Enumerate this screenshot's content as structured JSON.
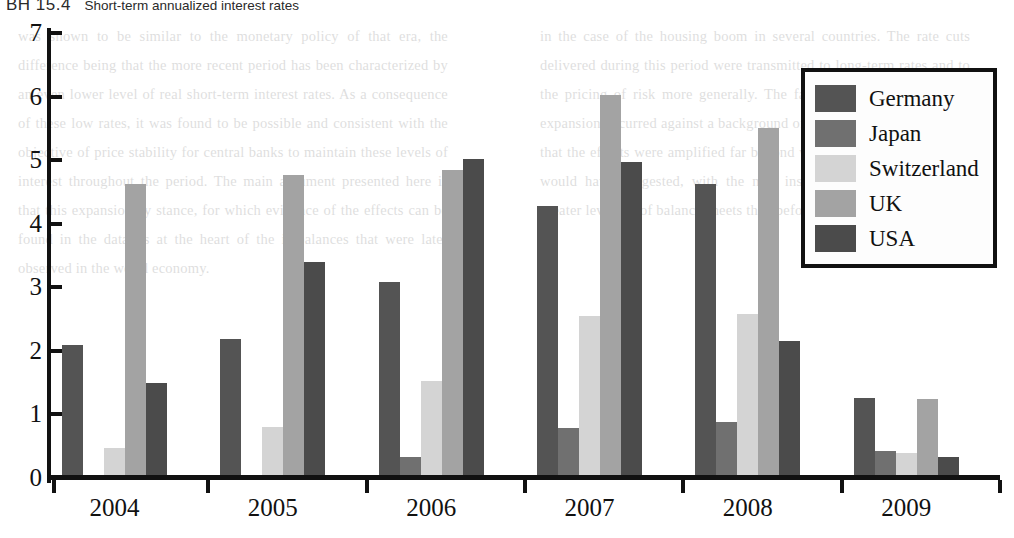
{
  "figure": {
    "number": "BH 15.4",
    "title": "Short-term annualized interest rates"
  },
  "background_text": {
    "left": "was shown to be similar to the monetary policy of that era, the difference being that the more recent period has been characterized by an even lower level of real short-term interest rates. As a consequence of these low rates, it was found to be possible and consistent with the objective of price stability for central banks to maintain these levels of interest throughout the period. The main argument presented here is that this expansionary stance, for which evidence of the effects can be found in the data, is at the heart of the imbalances that were later observed in the world economy.",
    "right": "in the case of the housing boom in several countries. The rate cuts delivered during this period were transmitted to long-term rates and to the pricing of risk more generally. The fact that the resulting credit expansion occurred against a background of financial innovation meant that the effects were amplified far beyond what historical relationships would have suggested, with the new instruments allowing a much greater leverage of balance sheets than before."
  },
  "legend": {
    "position": "right",
    "items": [
      {
        "label": "Germany",
        "color": "#545454"
      },
      {
        "label": "Japan",
        "color": "#707070"
      },
      {
        "label": "Switzerland",
        "color": "#d4d4d4"
      },
      {
        "label": "UK",
        "color": "#a3a3a3"
      },
      {
        "label": "USA",
        "color": "#4b4b4b"
      }
    ]
  },
  "chart_data": {
    "type": "bar",
    "title": "Short-term annualized interest rates",
    "xlabel": "",
    "ylabel": "",
    "ylim": [
      0,
      7
    ],
    "yticks": [
      0,
      1,
      2,
      3,
      4,
      5,
      6,
      7
    ],
    "grid": false,
    "categories": [
      "2004",
      "2005",
      "2006",
      "2007",
      "2008",
      "2009"
    ],
    "series": [
      {
        "name": "Germany",
        "color": "#545454",
        "values": [
          2.1,
          2.18,
          3.08,
          4.28,
          4.63,
          1.26
        ]
      },
      {
        "name": "Japan",
        "color": "#707070",
        "values": [
          0.05,
          0.05,
          0.33,
          0.78,
          0.88,
          0.42
        ]
      },
      {
        "name": "Switzerland",
        "color": "#d4d4d4",
        "values": [
          0.47,
          0.8,
          1.53,
          2.55,
          2.58,
          0.4
        ]
      },
      {
        "name": "UK",
        "color": "#a3a3a3",
        "values": [
          4.63,
          4.77,
          4.85,
          6.02,
          5.5,
          1.24
        ]
      },
      {
        "name": "USA",
        "color": "#4b4b4b",
        "values": [
          1.5,
          3.4,
          5.02,
          4.97,
          2.15,
          0.33
        ]
      }
    ]
  }
}
